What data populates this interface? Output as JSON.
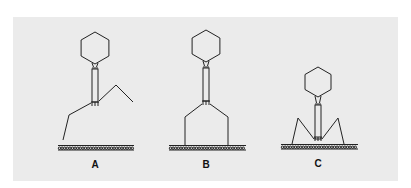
{
  "figure": {
    "background": "#ffffff",
    "panel_color": "#ebebeb",
    "stroke_color": "#222222",
    "panels": [
      {
        "id": "A",
        "label": "A",
        "description": "Phage approaching membrane, tail fibers extended asymmetrically",
        "center_x": 95,
        "head_center_y": 48,
        "head_radius": 16,
        "tail_top": 69,
        "tail_bottom": 102,
        "membrane_y": 147,
        "membrane_x": [
          58,
          134
        ],
        "label_y": 159,
        "fibers": [
          [
            [
              91,
              103
            ],
            [
              69,
              115
            ],
            [
              63,
              140
            ]
          ],
          [
            [
              99,
              101
            ],
            [
              116,
              85
            ],
            [
              133,
              102
            ]
          ]
        ],
        "baseplate_y": 105
      },
      {
        "id": "B",
        "label": "B",
        "description": "Tail fibers attached to membrane",
        "center_x": 206,
        "head_center_y": 46,
        "head_radius": 16,
        "tail_top": 68,
        "tail_bottom": 101,
        "membrane_y": 147,
        "membrane_x": [
          169,
          246
        ],
        "label_y": 159,
        "fibers": [
          [
            [
              202,
              104
            ],
            [
              185,
              117
            ],
            [
              185,
              145
            ]
          ],
          [
            [
              210,
              104
            ],
            [
              228,
              117
            ],
            [
              228,
              145
            ]
          ]
        ],
        "baseplate_y": 104
      },
      {
        "id": "C",
        "label": "C",
        "description": "Tail sheath contracted, tail tube penetrates membrane",
        "center_x": 318,
        "head_center_y": 82,
        "head_radius": 15,
        "tail_top": 105,
        "tail_bottom": 139,
        "membrane_y": 146,
        "membrane_x": [
          281,
          358
        ],
        "label_y": 158,
        "fibers": [
          [
            [
              314,
              139
            ],
            [
              298,
              118
            ],
            [
              292,
              144
            ]
          ],
          [
            [
              322,
              139
            ],
            [
              338,
              118
            ],
            [
              344,
              144
            ]
          ]
        ],
        "baseplate_y": 140
      }
    ]
  }
}
